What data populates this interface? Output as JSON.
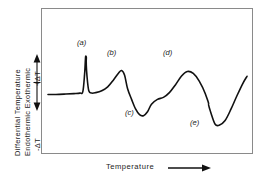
{
  "figure": {
    "background": "#ffffff",
    "line_color": "#111111",
    "frame_color": "#8a8a8a"
  },
  "axes": {
    "y_label_line1": "Differential  Temperature",
    "y_label_line2": "Endothermic  Exothermic",
    "y_positive_label": "+ΔT",
    "y_negative_label": "-ΔT",
    "x_label": "Temperature",
    "x_arrow": "arrow-right-icon",
    "y_up_arrow": "arrow-up-icon",
    "y_down_arrow": "arrow-down-icon"
  },
  "annotations": [
    {
      "id": "a",
      "text": "(a)"
    },
    {
      "id": "b",
      "text": "(b)"
    },
    {
      "id": "c",
      "text": "(c)"
    },
    {
      "id": "d",
      "text": "(d)"
    },
    {
      "id": "e",
      "text": "(e)"
    }
  ],
  "chart_data": {
    "type": "line",
    "title": "",
    "xlabel": "Temperature",
    "ylabel": "Differential Temperature (Endothermic / Exothermic)",
    "grid": false,
    "legend": false,
    "xlim": [
      0,
      100
    ],
    "ylim": [
      -1,
      1
    ],
    "axis_ticks": "none",
    "baseline": 0.0,
    "annotations": [
      {
        "label": "(a)",
        "type": "exothermic-sharp-peak",
        "x": 19,
        "y": 0.82
      },
      {
        "label": "(b)",
        "type": "exothermic-broad-peak",
        "x": 37,
        "y": 0.52
      },
      {
        "label": "(c)",
        "type": "endothermic-trough",
        "x": 48,
        "y": -0.42
      },
      {
        "label": "(d)",
        "type": "exothermic-broad-peak",
        "x": 70,
        "y": 0.5
      },
      {
        "label": "(e)",
        "type": "endothermic-trough",
        "x": 84,
        "y": -0.62
      }
    ],
    "series": [
      {
        "name": "DTA curve",
        "x": [
          0,
          4,
          9,
          13,
          16,
          17.5,
          18.4,
          19,
          19.6,
          20.5,
          22,
          24,
          27,
          30,
          33,
          35.5,
          37,
          38.5,
          40,
          42,
          44,
          46,
          48,
          50,
          52,
          55,
          58,
          61,
          64,
          67,
          70,
          73,
          76,
          79,
          82,
          84,
          86,
          89,
          92,
          95,
          98,
          100
        ],
        "y": [
          0.02,
          0.02,
          0.03,
          0.04,
          0.05,
          0.08,
          0.45,
          0.82,
          0.4,
          0.1,
          0.05,
          0.06,
          0.1,
          0.18,
          0.33,
          0.47,
          0.52,
          0.42,
          0.14,
          -0.08,
          -0.28,
          -0.4,
          -0.42,
          -0.34,
          -0.18,
          -0.08,
          -0.04,
          0.06,
          0.22,
          0.4,
          0.5,
          0.46,
          0.3,
          0.04,
          -0.38,
          -0.6,
          -0.62,
          -0.52,
          -0.28,
          0.0,
          0.26,
          0.4
        ]
      }
    ]
  }
}
